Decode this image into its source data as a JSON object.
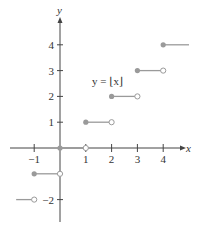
{
  "chart_data": {
    "type": "line",
    "title": "",
    "equation_label": "y = ⌊x⌋",
    "xlabel": "x",
    "ylabel": "y",
    "xlim": [
      -1.7,
      4.9
    ],
    "ylim": [
      -2.5,
      4.9
    ],
    "x_ticks": [
      -1,
      1,
      2,
      3,
      4
    ],
    "x_tick_labels": [
      "−1",
      "1",
      "2",
      "3",
      "4"
    ],
    "y_ticks": [
      -2,
      -1,
      1,
      2,
      3,
      4
    ],
    "y_tick_labels": [
      "−2",
      "",
      "1",
      "2",
      "3",
      "4"
    ],
    "grid": false,
    "legend": "none",
    "series": [
      {
        "name": "y = floor(x)",
        "segments": [
          {
            "x_start": -1.7,
            "x_end": -1,
            "y": -2,
            "start_closed": null,
            "end_closed": false
          },
          {
            "x_start": -1,
            "x_end": 0,
            "y": -1,
            "start_closed": true,
            "end_closed": false
          },
          {
            "x_start": 0,
            "x_end": 1,
            "y": 0,
            "start_closed": true,
            "end_closed": false
          },
          {
            "x_start": 1,
            "x_end": 2,
            "y": 1,
            "start_closed": true,
            "end_closed": false
          },
          {
            "x_start": 2,
            "x_end": 3,
            "y": 2,
            "start_closed": true,
            "end_closed": false
          },
          {
            "x_start": 3,
            "x_end": 4,
            "y": 3,
            "start_closed": true,
            "end_closed": false
          },
          {
            "x_start": 4,
            "x_end": 5.0,
            "y": 4,
            "start_closed": true,
            "end_closed": null
          }
        ]
      }
    ],
    "colors": {
      "axis": "#444444",
      "step": "#9a9a9a",
      "open_fill": "#ffffff"
    }
  }
}
